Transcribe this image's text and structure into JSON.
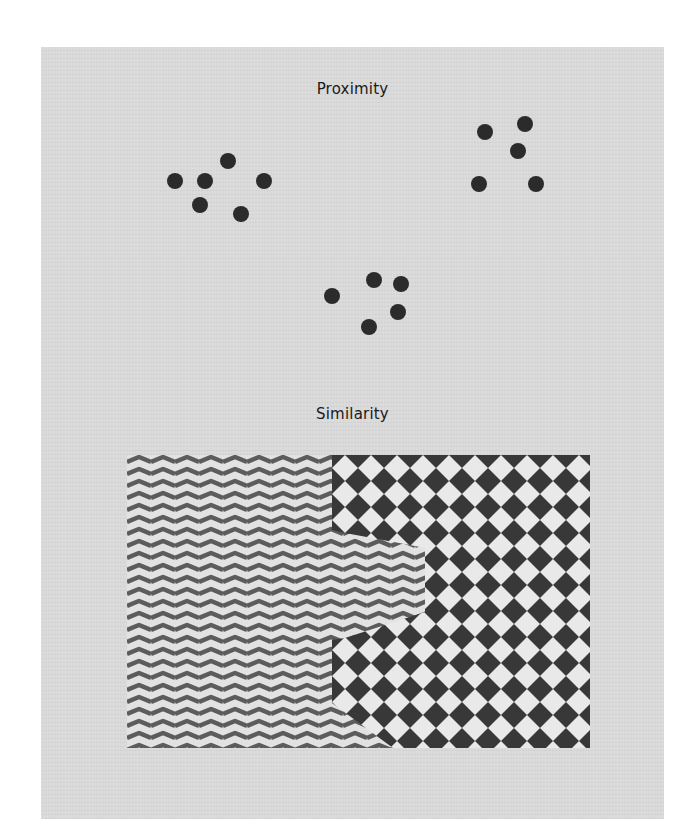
{
  "proximity": {
    "title": "Proximity",
    "dot_color": "#2b2b2b",
    "dot_radius": 8,
    "clusters": [
      {
        "name": "cluster-left",
        "dots": [
          [
            175,
            181
          ],
          [
            205,
            181
          ],
          [
            228,
            161
          ],
          [
            264,
            181
          ],
          [
            200,
            205
          ],
          [
            241,
            214
          ]
        ]
      },
      {
        "name": "cluster-right",
        "dots": [
          [
            485,
            132
          ],
          [
            525,
            124
          ],
          [
            518,
            151
          ],
          [
            479,
            184
          ],
          [
            536,
            184
          ]
        ]
      },
      {
        "name": "cluster-bottom",
        "dots": [
          [
            332,
            296
          ],
          [
            374,
            280
          ],
          [
            401,
            284
          ],
          [
            398,
            312
          ],
          [
            369,
            327
          ]
        ]
      }
    ]
  },
  "similarity": {
    "title": "Similarity",
    "region": {
      "x": 127,
      "y": 455,
      "width": 463,
      "height": 293
    },
    "zigzag": {
      "stripe_color": "#5c5c5c",
      "background_color": "#e2e2e2",
      "period": 24,
      "line_spacing": 12
    },
    "checker": {
      "dark_color": "#383838",
      "light_color": "#e9e9e9",
      "cell": 26
    },
    "checker_boundary": [
      [
        332,
        455
      ],
      [
        590,
        455
      ],
      [
        590,
        748
      ],
      [
        393,
        748
      ],
      [
        332,
        703
      ],
      [
        332,
        640
      ],
      [
        345,
        638
      ],
      [
        425,
        612
      ],
      [
        425,
        548
      ],
      [
        410,
        545
      ],
      [
        345,
        533
      ],
      [
        332,
        530
      ]
    ]
  }
}
